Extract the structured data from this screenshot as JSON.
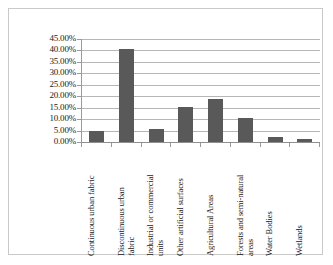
{
  "chart_data": {
    "type": "bar",
    "title": "",
    "subtitle": "",
    "xlabel": "",
    "ylabel": "",
    "ylim": [
      0,
      45
    ],
    "ytick_format": "percent",
    "grid": true,
    "legend": false,
    "bar_color": "#595959",
    "gridline_color": "#b6b6b6",
    "axis_color": "#8f8f8f",
    "frame_color": "#c9c9c9",
    "background": "#ffffff",
    "ytick_labels": [
      "45.00%",
      "40.00%",
      "35.00%",
      "30.00%",
      "25.00%",
      "20.00%",
      "15.00%",
      "10.00%",
      "5.00%",
      "0.00%"
    ],
    "ytick_values": [
      45,
      40,
      35,
      30,
      25,
      20,
      15,
      10,
      5,
      0
    ],
    "categories": [
      "Continuous urban fabric",
      "Discontinuous urban fabric",
      "Industrial or commercial units",
      "Other artificial surfaces",
      "Agricultural Areas",
      "Forests and semi-natural areas",
      "Water Bodies",
      "Wetlands"
    ],
    "category_label_lines": [
      "Continuous urban fabric",
      "Discontinuous urban\nfabric",
      "Industrial or commercial\nunits",
      "Other artificial surfaces",
      "Agricultural Areas",
      "Forests and semi-natural\nareas",
      "Water Bodies",
      "Wetlands"
    ],
    "values": [
      4.8,
      40.5,
      5.6,
      15.5,
      18.8,
      10.7,
      2.3,
      1.2
    ],
    "value_labels": [
      "4.80%",
      "40.50%",
      "5.60%",
      "15.50%",
      "18.80%",
      "10.70%",
      "2.30%",
      "1.20%"
    ]
  }
}
